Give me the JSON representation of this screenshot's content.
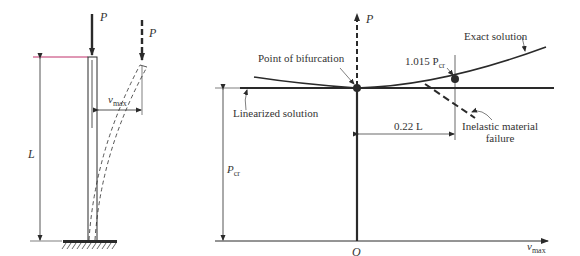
{
  "left_figure": {
    "load_label": "P",
    "deflected_load_label": "P",
    "length_label": "L",
    "deflection_label": "v",
    "deflection_sub": "max"
  },
  "right_figure": {
    "y_axis_label": "P",
    "x_axis_label": "v",
    "x_axis_sub": "max",
    "origin_label": "O",
    "pcr_label": "P",
    "pcr_sub": "cr",
    "bifurcation_label": "Point of bifurcation",
    "exact_solution_label": "Exact solution",
    "linearized_solution_label": "Linearized solution",
    "load_point_label": "1.015 P",
    "load_point_sub": "cr",
    "offset_label": "0.22 L",
    "failure_label_line1": "Inelastic material",
    "failure_label_line2": "failure"
  },
  "colors": {
    "line": "#2a2a2a",
    "top_marker": "#c0306a"
  }
}
